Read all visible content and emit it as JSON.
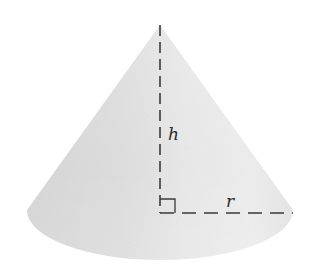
{
  "diagram": {
    "type": "right-circular-cone",
    "labels": {
      "height": "h",
      "radius": "r"
    },
    "colors": {
      "background": "#ffffff",
      "cone_light": "#ececec",
      "cone_mid": "#dcdcdc",
      "cone_dark": "#cfcfcf",
      "dash_line": "#3a3a3a"
    },
    "annotations": {
      "right_angle_marker": true,
      "height_line_style": "dashed",
      "radius_line_style": "dashed"
    }
  }
}
